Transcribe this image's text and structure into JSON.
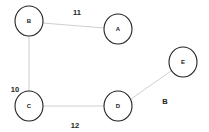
{
  "graph": {
    "nodes": [
      {
        "id": "B",
        "label": "B",
        "x": 29,
        "y": 21,
        "rx": 14,
        "ry": 15
      },
      {
        "id": "A",
        "label": "A",
        "x": 118,
        "y": 29,
        "rx": 14,
        "ry": 15
      },
      {
        "id": "E",
        "label": "E",
        "x": 183,
        "y": 62,
        "rx": 14,
        "ry": 15
      },
      {
        "id": "C",
        "label": "C",
        "x": 29,
        "y": 106,
        "rx": 14,
        "ry": 15
      },
      {
        "id": "D",
        "label": "D",
        "x": 118,
        "y": 106,
        "rx": 14,
        "ry": 15
      }
    ],
    "edges": [
      {
        "from": "B",
        "to": "A",
        "weight": "11",
        "label_x": 77,
        "label_y": 12
      },
      {
        "from": "B",
        "to": "C",
        "weight": "10",
        "label_x": 15,
        "label_y": 89
      },
      {
        "from": "C",
        "to": "D",
        "weight": "12",
        "label_x": 75,
        "label_y": 125
      },
      {
        "from": "D",
        "to": "E",
        "weight": "B",
        "label_x": 165,
        "label_y": 101
      }
    ]
  }
}
